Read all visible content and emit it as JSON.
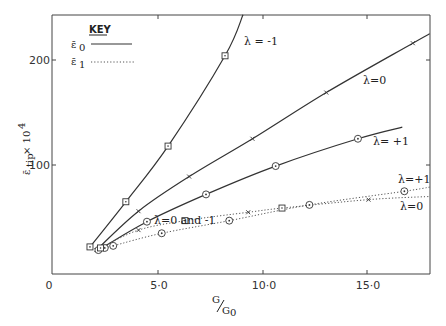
{
  "chart_data": {
    "type": "line",
    "title": "",
    "xlabel": "G/G0",
    "ylabel": "ε̄tip × 10^4",
    "xlim": [
      0,
      18
    ],
    "ylim": [
      0,
      240
    ],
    "grid": false,
    "x_ticks": [
      "0",
      "5·0",
      "10·0",
      "15·0"
    ],
    "x_tick_values": [
      0,
      5,
      10,
      15
    ],
    "y_ticks": [
      "100",
      "200"
    ],
    "y_tick_values": [
      100,
      200
    ],
    "legend": {
      "title": "KEY",
      "position": "upper-left",
      "entries": [
        {
          "label": "ε̄0",
          "style": "solid"
        },
        {
          "label": "ε̄1",
          "style": "dotted"
        }
      ]
    },
    "series": [
      {
        "name": "ε̄0, λ = -1",
        "label": "λ = -1",
        "style": "solid",
        "marker": "square",
        "x": [
          1.8,
          3.5,
          5.5,
          8.2,
          9.05
        ],
        "y": [
          22,
          65,
          118,
          204,
          243
        ]
      },
      {
        "name": "ε̄0, λ = 0",
        "label": "λ = 0",
        "style": "solid",
        "marker": "x",
        "x": [
          2.1,
          4.1,
          6.5,
          9.5,
          13.0,
          17.1,
          17.9
        ],
        "y": [
          19,
          56,
          89,
          125,
          169,
          216,
          225
        ]
      },
      {
        "name": "ε̄0, λ = +1",
        "label": "λ = +1",
        "style": "solid",
        "marker": "circle",
        "x": [
          2.2,
          4.5,
          7.3,
          10.6,
          14.5,
          16.6
        ],
        "y": [
          19,
          46,
          72,
          99,
          125,
          136
        ]
      },
      {
        "name": "ε̄1, λ = +1",
        "label": "λ = +1",
        "style": "dotted",
        "marker": "circle",
        "x": [
          2.5,
          2.9,
          5.2,
          8.4,
          12.2,
          16.7,
          17.9
        ],
        "y": [
          21,
          23,
          35,
          47,
          62,
          75,
          79
        ]
      },
      {
        "name": "ε̄1, λ = 0 and -1",
        "label": "λ = 0",
        "style": "dotted",
        "marker": "square/x",
        "x": [
          2.3,
          4.1,
          6.3,
          9.3,
          10.9,
          15.0,
          17.9
        ],
        "y": [
          21,
          38,
          47,
          55,
          59,
          67,
          70
        ]
      }
    ],
    "annotations": [
      "λ = -1",
      "λ = 0",
      "λ = +1",
      "λ = 0 and -1",
      "λ = +1",
      "λ = 0"
    ]
  },
  "labels": {
    "key_title": "KEY",
    "key_e0": "ε̄",
    "key_e0_sub": "0",
    "key_e1": "ε̄",
    "key_e1_sub": "1",
    "ylabel_main": "ε̄",
    "ylabel_sub": "tip",
    "ylabel_tail": " × 10",
    "ylabel_sup": "4",
    "xlabel_num": "G",
    "xlabel_den": "G",
    "xlabel_den_sub": "0",
    "x0": "0",
    "x5": "5·0",
    "x10": "10·0",
    "x15": "15·0",
    "y100": "100",
    "y200": "200",
    "lam_m1": "λ = -1",
    "lam_0": "λ=0",
    "lam_p1": "λ= +1",
    "lam_0m1": "λ=0 and -1",
    "lam_p1_dot": "λ=+1",
    "lam_0_dot": "λ=0"
  }
}
